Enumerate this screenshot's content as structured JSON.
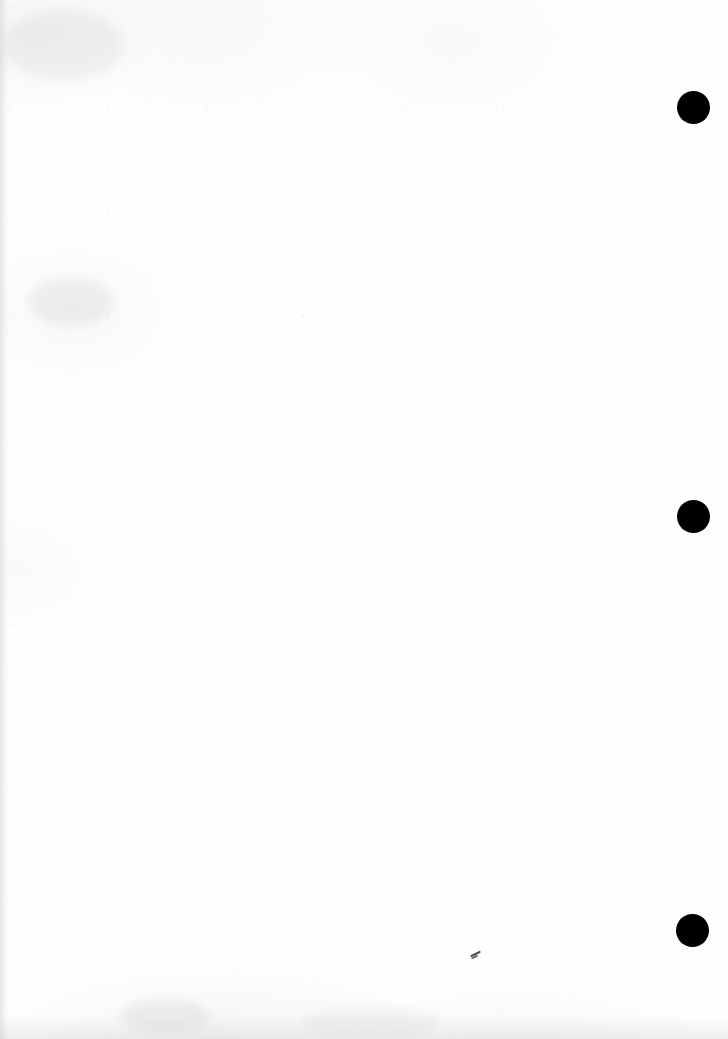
{
  "document": {
    "kind": "scanned-page",
    "description": "Blank scanned paper page",
    "page_width": 728,
    "page_height": 1039,
    "paper_color": "#fefefe",
    "ink_color": "#000000",
    "body_text": "",
    "visible_text": ""
  },
  "marks": {
    "punch_dots": [
      {
        "name": "punch-dot-top",
        "cx": 694,
        "cy": 108,
        "d": 33,
        "color": "#000000"
      },
      {
        "name": "punch-dot-middle",
        "cx": 694,
        "cy": 517,
        "d": 33,
        "color": "#000000"
      },
      {
        "name": "punch-dot-bottom",
        "cx": 693,
        "cy": 931,
        "d": 33,
        "color": "#000000"
      }
    ],
    "pencil_tick": {
      "name": "pencil-tick",
      "x": 470,
      "y": 953,
      "color": "#4a4a4d"
    },
    "smudges": [
      {
        "name": "smudge-upper-left",
        "x": 28,
        "y": 278,
        "w": 86,
        "h": 48,
        "opacity": 0.1
      },
      {
        "name": "smudge-top-left",
        "x": 4,
        "y": 10,
        "w": 120,
        "h": 70,
        "opacity": 0.09
      },
      {
        "name": "smudge-bottom-left",
        "x": 120,
        "y": 1000,
        "w": 90,
        "h": 32,
        "opacity": 0.12
      },
      {
        "name": "smudge-bottom-mid",
        "x": 300,
        "y": 1008,
        "w": 140,
        "h": 28,
        "opacity": 0.08
      }
    ]
  }
}
